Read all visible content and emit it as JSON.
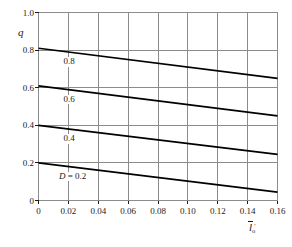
{
  "chart_data": {
    "type": "line",
    "title": "",
    "subtitle": "",
    "xlabel": "l̄o′",
    "xlabel_parts": {
      "symbol": "l",
      "overline": true,
      "subscript": "o",
      "superscript": "′"
    },
    "ylabel": "q",
    "xlim": [
      0,
      0.16
    ],
    "ylim": [
      0,
      1.0
    ],
    "grid": true,
    "grid_x_step": 0.02,
    "grid_y_step": 0.2,
    "legend": "inline-curve-labels",
    "legend_position": "on-curve",
    "x_ticks": [
      "0",
      "0.02",
      "0.04",
      "0.06",
      "0.08",
      "0.10",
      "0.12",
      "0.14",
      "0.16"
    ],
    "x_tick_values": [
      0,
      0.02,
      0.04,
      0.06,
      0.08,
      0.1,
      0.12,
      0.14,
      0.16
    ],
    "y_ticks": [
      "0",
      "0.2",
      "0.4",
      "0.6",
      "0.8",
      "1.0"
    ],
    "y_tick_values": [
      0,
      0.2,
      0.4,
      0.6,
      0.8,
      1.0
    ],
    "x": [
      0,
      0.16
    ],
    "series": [
      {
        "name": "D = 0.8",
        "label": "0.8",
        "values": [
          0.81,
          0.65
        ],
        "label_x": 0.016,
        "label_y": 0.735
      },
      {
        "name": "D = 0.6",
        "label": "0.6",
        "values": [
          0.61,
          0.45
        ],
        "label_x": 0.016,
        "label_y": 0.535
      },
      {
        "name": "D = 0.4",
        "label": "0.4",
        "values": [
          0.4,
          0.245
        ],
        "label_x": 0.016,
        "label_y": 0.325
      },
      {
        "name": "D = 0.2",
        "label": "D = 0.2",
        "label_italic_prefix": "D",
        "label_rest": " = 0.2",
        "values": [
          0.2,
          0.045
        ],
        "label_x": 0.013,
        "label_y": 0.125
      }
    ],
    "colors": {
      "curve": "#000000",
      "grid": "#8c8c8c",
      "frame": "#8c8c8c",
      "text": "#1a1a1a",
      "background": "#ffffff"
    }
  },
  "axes": {
    "x_title_text": "l o",
    "y_title_text": "q"
  }
}
